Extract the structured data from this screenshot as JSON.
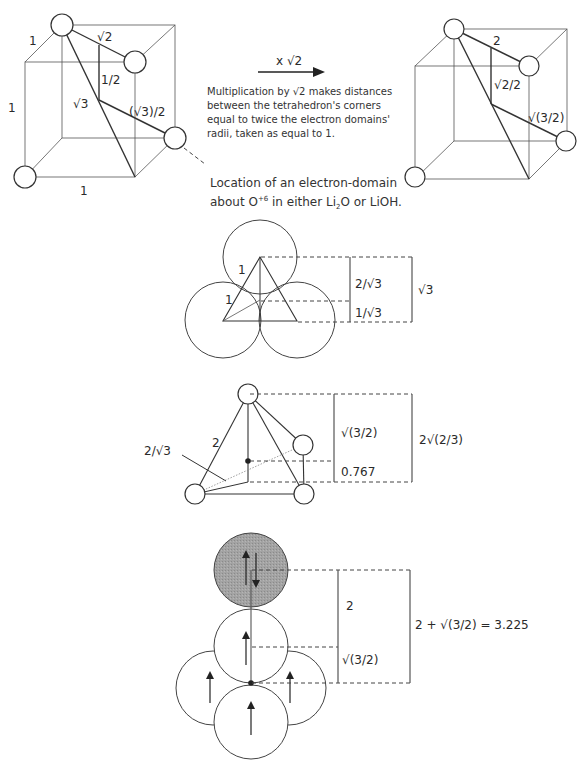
{
  "figure": {
    "left_cube": {
      "edge_labels": {
        "top": "1",
        "side": "1",
        "bottom": "1"
      },
      "segment_labels": {
        "face_diagonal": "√2",
        "half": "1/2",
        "body_diagonal": "√3",
        "center_to_corner": "(√3)/2"
      }
    },
    "arrow": {
      "label": "x √2"
    },
    "scaling_note": "Multiplication by √2 makes distances between the tetrahedron's corners equal to twice the electron domains' radii, taken as equal to 1.",
    "location_note": {
      "line1": "Location of an electron-domain",
      "line2_prefix": "about O",
      "line2_superscript": "+6",
      "line2_mid": " in either Li",
      "line2_subscript": "2",
      "line2_suffix": "O or LiOH."
    },
    "right_cube": {
      "segment_labels": {
        "face_diagonal": "2",
        "half": "√2/2",
        "center_to_corner": "√(3/2)"
      }
    },
    "triangle_view": {
      "edge_labels": [
        "1",
        "1"
      ],
      "dimension_labels": {
        "upper": "2/√3",
        "lower": "1/√3",
        "total": "√3"
      }
    },
    "tetrahedron_view": {
      "edge_label": "2",
      "leader_label": "2/√3",
      "dimension_labels": {
        "upper": "√(3/2)",
        "lower": "0.767",
        "total": "2√(2/3)"
      }
    },
    "stack_view": {
      "dimension_labels": {
        "upper": "2",
        "lower": "√(3/2)",
        "total": "2 + √(3/2) = 3.225"
      }
    },
    "colors": {
      "line": "#333333",
      "shaded_domain": "#9a9a9a",
      "background": "#ffffff"
    }
  }
}
